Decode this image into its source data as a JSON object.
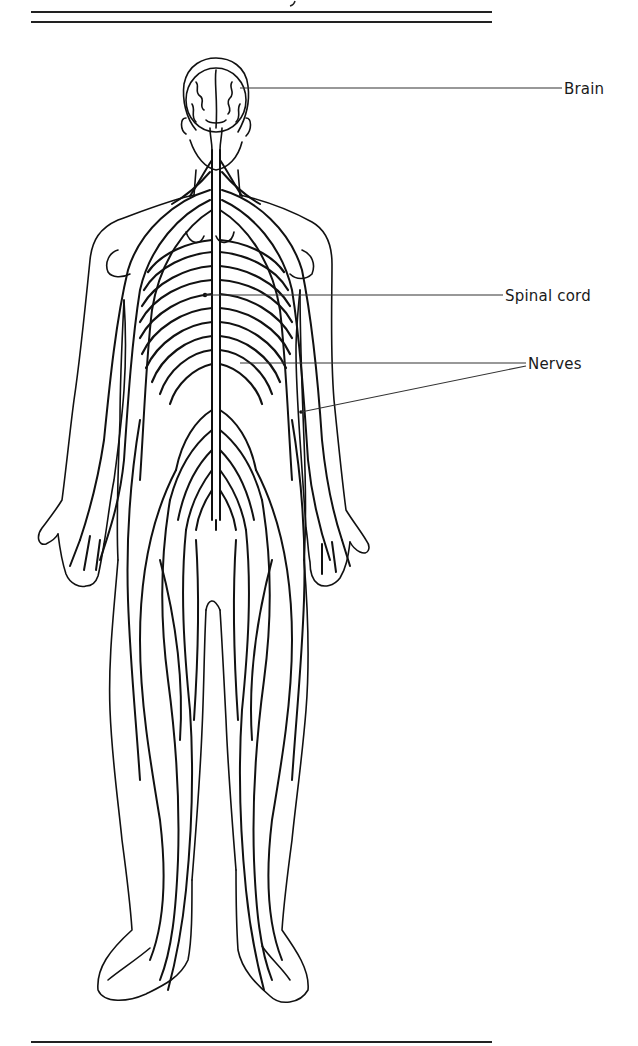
{
  "figure": {
    "labels": [
      {
        "id": "brain",
        "text": "Brain"
      },
      {
        "id": "spinal_cord",
        "text": "Spinal cord"
      },
      {
        "id": "nerves",
        "text": "Nerves"
      }
    ]
  },
  "colors": {
    "ink": "#111111",
    "background": "#ffffff",
    "rule": "#222222"
  }
}
